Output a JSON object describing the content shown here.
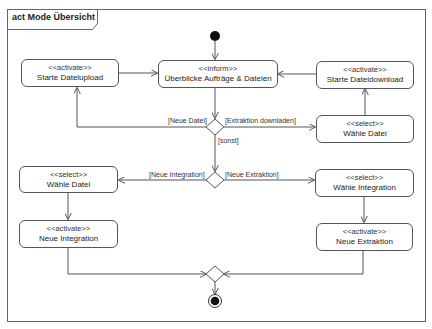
{
  "diagram": {
    "type": "UML activity diagram",
    "frame_title": "act Mode Übersicht",
    "actions": [
      {
        "id": "upload",
        "stereotype": "<<activate>>",
        "name": "Starte Dateiupload"
      },
      {
        "id": "overview",
        "stereotype": "<<inform>>",
        "name": "Überblicke Aufträge & Dateien"
      },
      {
        "id": "download",
        "stereotype": "<<activate>>",
        "name": "Starte Dateidownload"
      },
      {
        "id": "select_file_right",
        "stereotype": "<<select>>",
        "name": "Wähle Datei"
      },
      {
        "id": "select_file_left",
        "stereotype": "<<select>>",
        "name": "Wähle Datei"
      },
      {
        "id": "select_integration",
        "stereotype": "<<select>>",
        "name": "Wähle Integration"
      },
      {
        "id": "new_integration",
        "stereotype": "<<activate>>",
        "name": "Neue Integration"
      },
      {
        "id": "new_extraction",
        "stereotype": "<<activate>>",
        "name": "Neue Extraktion"
      }
    ],
    "guards": {
      "neue_datei": "[Neue Datei]",
      "extraktion_downladen": "[Extraktion downladen]",
      "sonst": "[sonst]",
      "neue_integration": "[Neue Integration]",
      "neue_extraktion": "[Neue Extraktion]"
    },
    "flows": [
      {
        "from": "initial",
        "to": "overview"
      },
      {
        "from": "upload",
        "to": "overview"
      },
      {
        "from": "download",
        "to": "overview"
      },
      {
        "from": "overview",
        "to": "decision1"
      },
      {
        "from": "decision1",
        "to": "upload",
        "guard": "[Neue Datei]"
      },
      {
        "from": "decision1",
        "to": "select_file_right",
        "guard": "[Extraktion downladen]"
      },
      {
        "from": "select_file_right",
        "to": "download"
      },
      {
        "from": "decision1",
        "to": "decision2",
        "guard": "[sonst]"
      },
      {
        "from": "decision2",
        "to": "select_file_left",
        "guard": "[Neue Integration]"
      },
      {
        "from": "decision2",
        "to": "select_integration",
        "guard": "[Neue Extraktion]"
      },
      {
        "from": "select_file_left",
        "to": "new_integration"
      },
      {
        "from": "select_integration",
        "to": "new_extraction"
      },
      {
        "from": "new_integration",
        "to": "merge"
      },
      {
        "from": "new_extraction",
        "to": "merge"
      },
      {
        "from": "merge",
        "to": "final"
      }
    ],
    "colors": {
      "line": "#555555",
      "node_fill": "#ffffff",
      "initial": "#111111"
    }
  }
}
